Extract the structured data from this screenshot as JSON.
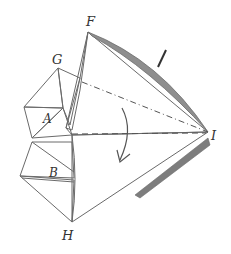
{
  "diagram": {
    "type": "origami-fold-step",
    "labels": {
      "F": "F",
      "G": "G",
      "A": "A",
      "B": "B",
      "H": "H",
      "I": "I"
    },
    "annotations": {
      "fold_lines": [
        "valley fold F–I region (dash-dot)",
        "horizontal dashed fold toward I"
      ],
      "action_arrow": "curved fold arrow (downward)",
      "tick_mark": "short stroke near upper edge"
    },
    "colors": {
      "paper_light": "#f2f2f2",
      "paper_mid": "#c9c9c9",
      "paper_dark": "#8e8e8e",
      "line": "#6a6a6a",
      "shadow": "#7d7d7d"
    }
  }
}
